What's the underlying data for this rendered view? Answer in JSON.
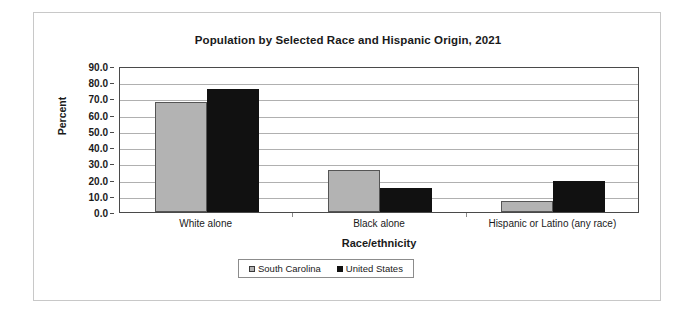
{
  "chart_data": {
    "type": "bar",
    "title": "Population by Selected Race and Hispanic Origin, 2021",
    "xlabel": "Race/ethnicity",
    "ylabel": "Percent",
    "categories": [
      "White alone",
      "Black alone",
      "Hispanic or Latino (any race)"
    ],
    "series": [
      {
        "name": "South Carolina",
        "color": "#b3b3b3",
        "values": [
          68.0,
          26.0,
          6.5
        ]
      },
      {
        "name": "United States",
        "color": "#111111",
        "values": [
          75.8,
          14.9,
          18.9
        ]
      }
    ],
    "ylim": [
      0.0,
      90.0
    ],
    "ytick_step": 10.0,
    "ytick_labels": [
      "90.0",
      "80.0",
      "70.0",
      "60.0",
      "50.0",
      "40.0",
      "30.0",
      "20.0",
      "10.0",
      "0.0"
    ],
    "ytick_values": [
      90.0,
      80.0,
      70.0,
      60.0,
      50.0,
      40.0,
      30.0,
      20.0,
      10.0,
      0.0
    ],
    "grid": true,
    "legend_position": "bottom"
  }
}
